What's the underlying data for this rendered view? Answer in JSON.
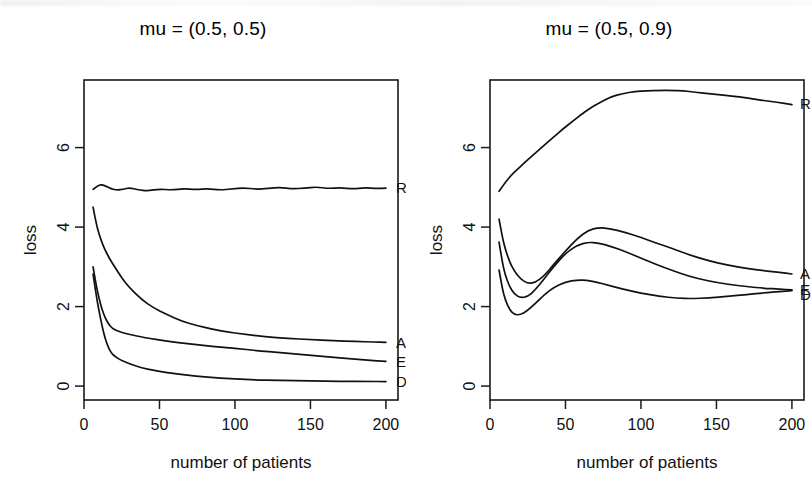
{
  "figure": {
    "background_color": "#ffffff",
    "line_color": "#111111",
    "top_artifact_text": ""
  },
  "chart_data": [
    {
      "type": "line",
      "title": "mu = (0.5, 0.5)",
      "xlabel": "number of patients",
      "ylabel": "loss",
      "xlim": [
        0,
        208
      ],
      "ylim": [
        -0.35,
        7.7
      ],
      "xticks": [
        0,
        50,
        100,
        150,
        200
      ],
      "xticklabels": [
        "0",
        "50",
        "100",
        "150",
        "200"
      ],
      "yticks": [
        0,
        2,
        4,
        6
      ],
      "yticklabels": [
        "0",
        "2",
        "4",
        "6"
      ],
      "grid": false,
      "legend_position": "right-inline",
      "series": [
        {
          "name": "R",
          "label": "R",
          "label_x": 200,
          "label_y": 5.0,
          "x": [
            6,
            10,
            14,
            18,
            22,
            26,
            30,
            36,
            42,
            50,
            58,
            66,
            74,
            82,
            90,
            98,
            106,
            114,
            122,
            130,
            138,
            146,
            154,
            162,
            170,
            178,
            186,
            194,
            200
          ],
          "y": [
            4.95,
            5.08,
            5.04,
            4.96,
            4.93,
            4.95,
            4.99,
            4.94,
            4.91,
            4.96,
            4.93,
            4.97,
            4.94,
            4.97,
            4.93,
            4.96,
            4.99,
            4.95,
            4.97,
            5.0,
            4.96,
            4.98,
            5.01,
            4.97,
            4.99,
            4.96,
            4.99,
            4.97,
            4.98
          ]
        },
        {
          "name": "A",
          "label": "A",
          "label_x": 200,
          "label_y": 1.1,
          "x": [
            6,
            8,
            10,
            12,
            14,
            17,
            20,
            25,
            30,
            38,
            46,
            55,
            65,
            75,
            85,
            95,
            105,
            120,
            135,
            150,
            165,
            180,
            192,
            200
          ],
          "y": [
            4.5,
            4.1,
            3.82,
            3.6,
            3.42,
            3.2,
            3.02,
            2.72,
            2.48,
            2.18,
            1.97,
            1.8,
            1.63,
            1.52,
            1.43,
            1.36,
            1.31,
            1.24,
            1.2,
            1.17,
            1.14,
            1.12,
            1.11,
            1.1
          ]
        },
        {
          "name": "E",
          "label": "E",
          "label_x": 200,
          "label_y": 0.62,
          "x": [
            6,
            8,
            10,
            12,
            14,
            16,
            18,
            20,
            24,
            30,
            40,
            55,
            70,
            85,
            100,
            115,
            130,
            145,
            160,
            175,
            188,
            200
          ],
          "y": [
            3.0,
            2.55,
            2.2,
            1.92,
            1.72,
            1.58,
            1.48,
            1.42,
            1.36,
            1.3,
            1.22,
            1.13,
            1.06,
            1.0,
            0.95,
            0.89,
            0.84,
            0.79,
            0.74,
            0.69,
            0.65,
            0.62
          ]
        },
        {
          "name": "D",
          "label": "D",
          "label_x": 200,
          "label_y": 0.12,
          "x": [
            6,
            8,
            10,
            12,
            14,
            16,
            18,
            20,
            24,
            30,
            38,
            48,
            60,
            74,
            90,
            110,
            130,
            150,
            170,
            188,
            200
          ],
          "y": [
            2.82,
            2.3,
            1.88,
            1.5,
            1.2,
            0.98,
            0.84,
            0.76,
            0.66,
            0.56,
            0.46,
            0.38,
            0.31,
            0.25,
            0.2,
            0.16,
            0.14,
            0.13,
            0.12,
            0.12,
            0.11
          ]
        }
      ]
    },
    {
      "type": "line",
      "title": "mu = (0.5, 0.9)",
      "xlabel": "number of patients",
      "ylabel": "loss",
      "xlim": [
        0,
        208
      ],
      "ylim": [
        -0.35,
        7.7
      ],
      "xticks": [
        0,
        50,
        100,
        150,
        200
      ],
      "xticklabels": [
        "0",
        "50",
        "100",
        "150",
        "200"
      ],
      "yticks": [
        0,
        2,
        4,
        6
      ],
      "yticklabels": [
        "0",
        "2",
        "4",
        "6"
      ],
      "grid": false,
      "legend_position": "right-inline",
      "series": [
        {
          "name": "R",
          "label": "R",
          "label_x": 200,
          "label_y": 7.1,
          "x": [
            6,
            10,
            14,
            18,
            24,
            30,
            36,
            42,
            48,
            54,
            60,
            66,
            72,
            80,
            88,
            96,
            104,
            112,
            120,
            128,
            136,
            144,
            152,
            160,
            170,
            180,
            190,
            200
          ],
          "y": [
            4.9,
            5.12,
            5.3,
            5.45,
            5.66,
            5.86,
            6.06,
            6.26,
            6.46,
            6.64,
            6.82,
            6.98,
            7.12,
            7.28,
            7.36,
            7.41,
            7.43,
            7.44,
            7.44,
            7.43,
            7.39,
            7.36,
            7.33,
            7.3,
            7.25,
            7.19,
            7.14,
            7.08
          ]
        },
        {
          "name": "A",
          "label": "A",
          "label_x": 200,
          "label_y": 2.82,
          "x": [
            6,
            8,
            10,
            13,
            16,
            20,
            25,
            30,
            36,
            42,
            50,
            58,
            65,
            72,
            80,
            90,
            100,
            110,
            120,
            132,
            145,
            158,
            170,
            182,
            192,
            200
          ],
          "y": [
            4.2,
            3.78,
            3.46,
            3.12,
            2.9,
            2.7,
            2.58,
            2.6,
            2.78,
            3.05,
            3.4,
            3.72,
            3.92,
            3.99,
            3.96,
            3.86,
            3.74,
            3.6,
            3.47,
            3.3,
            3.15,
            3.04,
            2.96,
            2.9,
            2.86,
            2.82
          ]
        },
        {
          "name": "E",
          "label": "E",
          "label_x": 200,
          "label_y": 2.42,
          "x": [
            6,
            8,
            10,
            13,
            16,
            20,
            25,
            30,
            36,
            42,
            50,
            58,
            65,
            72,
            80,
            90,
            100,
            110,
            120,
            132,
            145,
            158,
            170,
            182,
            192,
            200
          ],
          "y": [
            3.62,
            3.15,
            2.8,
            2.5,
            2.32,
            2.22,
            2.25,
            2.42,
            2.7,
            3.0,
            3.34,
            3.55,
            3.62,
            3.6,
            3.52,
            3.38,
            3.22,
            3.06,
            2.92,
            2.76,
            2.64,
            2.56,
            2.5,
            2.46,
            2.44,
            2.42
          ]
        },
        {
          "name": "D",
          "label": "D",
          "label_x": 200,
          "label_y": 2.3,
          "x": [
            6,
            8,
            10,
            13,
            16,
            20,
            25,
            30,
            36,
            42,
            50,
            58,
            64,
            70,
            78,
            88,
            100,
            112,
            124,
            134,
            145,
            158,
            170,
            182,
            192,
            200
          ],
          "y": [
            2.92,
            2.48,
            2.18,
            1.92,
            1.8,
            1.79,
            1.9,
            2.08,
            2.3,
            2.48,
            2.62,
            2.67,
            2.66,
            2.62,
            2.54,
            2.44,
            2.34,
            2.26,
            2.21,
            2.2,
            2.22,
            2.26,
            2.3,
            2.35,
            2.38,
            2.4
          ]
        }
      ]
    }
  ]
}
